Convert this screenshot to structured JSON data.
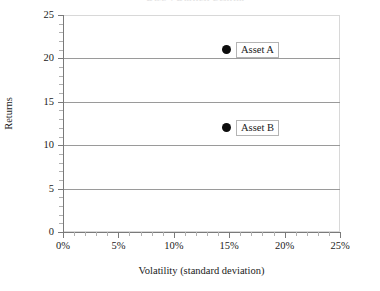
{
  "title_remnant": "Risk / Return Profile",
  "chart_data": {
    "type": "scatter",
    "title": "",
    "xlabel": "Volatility (standard deviation)",
    "ylabel": "Returns",
    "xlim": [
      0,
      25
    ],
    "ylim": [
      0,
      25
    ],
    "grid": "horizontal-major",
    "legend": "none",
    "x_tick_labels": [
      "0%",
      "5%",
      "10%",
      "15%",
      "20%",
      "25%"
    ],
    "x_tick_values": [
      0,
      5,
      10,
      15,
      20,
      25
    ],
    "x_minor_ticks_between": 4,
    "y_tick_labels": [
      "0",
      "5",
      "10",
      "15",
      "20",
      "25"
    ],
    "y_tick_values": [
      0,
      5,
      10,
      15,
      20,
      25
    ],
    "y_minor_ticks_between": 4,
    "points": [
      {
        "label": "Asset A",
        "x": 14.8,
        "y": 21.0,
        "marker": "filled-circle",
        "color": "#0d0d0d"
      },
      {
        "label": "Asset B",
        "x": 14.8,
        "y": 12.0,
        "marker": "filled-circle",
        "color": "#0d0d0d"
      }
    ]
  },
  "colors": {
    "marker": "#0d0d0d",
    "gridline": "#9a9a9a",
    "axis": "#7a7a7a",
    "plot_border": "#d8d8d8",
    "label_box_border": "#b4b4b4",
    "background": "#ffffff"
  }
}
